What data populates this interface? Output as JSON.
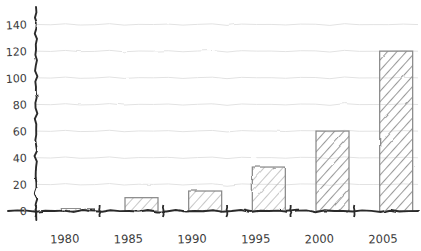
{
  "chart_data": {
    "type": "bar",
    "title": "",
    "subtitle": "",
    "xlabel": "",
    "ylabel": "",
    "categories": [
      "1980",
      "1985",
      "1990",
      "1995",
      "2000",
      "2005"
    ],
    "values": [
      2,
      10,
      15,
      33,
      60,
      120
    ],
    "ylim": [
      0,
      140
    ],
    "yticks": [
      0,
      20,
      40,
      60,
      80,
      100,
      120,
      140
    ],
    "ytick_labels": [
      "0",
      "20",
      "40",
      "60",
      "80",
      "100",
      "120",
      "140"
    ],
    "grid": true,
    "grid_axis": "y",
    "legend": false,
    "legend_position": "none",
    "style": "hand-drawn-sketch",
    "bar_fill": "hatched-diagonal",
    "annotations": []
  },
  "colors": {
    "axis": "#2b2b2b",
    "grid": "#e2e2e2",
    "bar_edge": "#8a8a8a",
    "bar_hatch": "#9a9a9a",
    "text": "#3b3b3b",
    "background": "#ffffff"
  },
  "icons": {
    "y_axis": "vertical-axis-line",
    "x_axis": "horizontal-axis-line"
  }
}
